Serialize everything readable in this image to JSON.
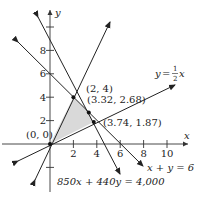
{
  "diagram": {
    "type": "linear-programming-feasible-region",
    "axes": {
      "x_label": "x",
      "y_label": "y",
      "x_ticks": [
        "2",
        "4",
        "6",
        "8",
        "10"
      ],
      "y_ticks": [
        "2",
        "4",
        "6",
        "8"
      ]
    },
    "lines": [
      {
        "label": "y = ½x",
        "eq_lhs": "y = ",
        "frac_num": "1",
        "frac_den": "2",
        "eq_var": "x"
      },
      {
        "label": "x + y = 6"
      },
      {
        "label": "850x + 440y = 4,000"
      },
      {
        "label": "y = 2x"
      }
    ],
    "points": [
      {
        "label": "(0, 0)"
      },
      {
        "label": "(2, 4)"
      },
      {
        "label": "(3.32, 2.68)"
      },
      {
        "label": "(3.74, 1.87)"
      }
    ],
    "region": {
      "fill": "#d9d9d9",
      "stroke": "#333333"
    },
    "colors": {
      "line": "#222222",
      "axis": "#333333"
    }
  }
}
